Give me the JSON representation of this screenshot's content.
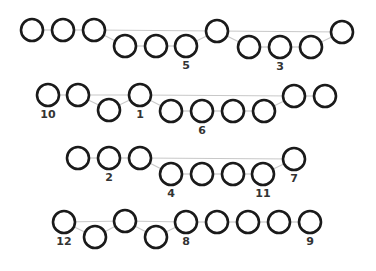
{
  "diagram": {
    "style": {
      "node_stroke": "#1a1a1a",
      "edge_stroke": "#c8c8c8",
      "label_color": "#333333",
      "node_radius": 11
    },
    "rows": [
      {
        "name": "row-1",
        "nodes": [
          {
            "x": 32,
            "y": 30,
            "label": ""
          },
          {
            "x": 63,
            "y": 30,
            "label": ""
          },
          {
            "x": 94,
            "y": 30,
            "label": ""
          },
          {
            "x": 125,
            "y": 46,
            "label": ""
          },
          {
            "x": 156,
            "y": 46,
            "label": ""
          },
          {
            "x": 186,
            "y": 46,
            "label": "5"
          },
          {
            "x": 217,
            "y": 31,
            "label": ""
          },
          {
            "x": 249,
            "y": 47,
            "label": ""
          },
          {
            "x": 280,
            "y": 47,
            "label": "3"
          },
          {
            "x": 311,
            "y": 47,
            "label": ""
          },
          {
            "x": 342,
            "y": 32,
            "label": ""
          }
        ],
        "edges": [
          [
            0,
            1
          ],
          [
            1,
            2
          ],
          [
            2,
            3
          ],
          [
            3,
            4
          ],
          [
            4,
            5
          ],
          [
            5,
            6
          ],
          [
            6,
            7
          ],
          [
            7,
            8
          ],
          [
            8,
            9
          ],
          [
            9,
            10
          ],
          [
            2,
            6
          ],
          [
            6,
            10
          ]
        ]
      },
      {
        "name": "row-2",
        "nodes": [
          {
            "x": 48,
            "y": 95,
            "label": "10"
          },
          {
            "x": 78,
            "y": 95,
            "label": ""
          },
          {
            "x": 109,
            "y": 110,
            "label": ""
          },
          {
            "x": 140,
            "y": 95,
            "label": "1"
          },
          {
            "x": 171,
            "y": 111,
            "label": ""
          },
          {
            "x": 202,
            "y": 111,
            "label": "6"
          },
          {
            "x": 233,
            "y": 111,
            "label": ""
          },
          {
            "x": 264,
            "y": 111,
            "label": ""
          },
          {
            "x": 294,
            "y": 96,
            "label": ""
          },
          {
            "x": 325,
            "y": 96,
            "label": ""
          }
        ],
        "edges": [
          [
            0,
            1
          ],
          [
            1,
            2
          ],
          [
            2,
            3
          ],
          [
            3,
            4
          ],
          [
            4,
            5
          ],
          [
            5,
            6
          ],
          [
            6,
            7
          ],
          [
            7,
            8
          ],
          [
            8,
            9
          ],
          [
            1,
            3
          ],
          [
            3,
            8
          ]
        ]
      },
      {
        "name": "row-3",
        "nodes": [
          {
            "x": 78,
            "y": 158,
            "label": ""
          },
          {
            "x": 109,
            "y": 158,
            "label": "2"
          },
          {
            "x": 140,
            "y": 158,
            "label": ""
          },
          {
            "x": 171,
            "y": 174,
            "label": "4"
          },
          {
            "x": 202,
            "y": 174,
            "label": ""
          },
          {
            "x": 233,
            "y": 174,
            "label": ""
          },
          {
            "x": 263,
            "y": 174,
            "label": "11"
          },
          {
            "x": 294,
            "y": 159,
            "label": "7"
          }
        ],
        "edges": [
          [
            0,
            1
          ],
          [
            1,
            2
          ],
          [
            2,
            3
          ],
          [
            3,
            4
          ],
          [
            4,
            5
          ],
          [
            5,
            6
          ],
          [
            6,
            7
          ],
          [
            2,
            7
          ]
        ]
      },
      {
        "name": "row-4",
        "nodes": [
          {
            "x": 64,
            "y": 222,
            "label": "12"
          },
          {
            "x": 95,
            "y": 237,
            "label": ""
          },
          {
            "x": 125,
            "y": 221,
            "label": ""
          },
          {
            "x": 156,
            "y": 237,
            "label": ""
          },
          {
            "x": 186,
            "y": 222,
            "label": "8"
          },
          {
            "x": 217,
            "y": 222,
            "label": ""
          },
          {
            "x": 248,
            "y": 222,
            "label": ""
          },
          {
            "x": 279,
            "y": 222,
            "label": ""
          },
          {
            "x": 310,
            "y": 222,
            "label": "9"
          }
        ],
        "edges": [
          [
            0,
            1
          ],
          [
            1,
            2
          ],
          [
            2,
            3
          ],
          [
            3,
            4
          ],
          [
            4,
            5
          ],
          [
            5,
            6
          ],
          [
            6,
            7
          ],
          [
            7,
            8
          ],
          [
            0,
            2
          ],
          [
            2,
            4
          ]
        ]
      }
    ]
  }
}
